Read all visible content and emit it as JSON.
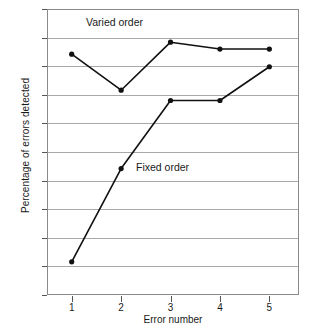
{
  "chart_data": {
    "type": "line",
    "title": "",
    "xlabel": "Error number",
    "ylabel": "Percentage of errors detected",
    "x": [
      1,
      2,
      3,
      4,
      5
    ],
    "xtick_labels": [
      "1",
      "2",
      "3",
      "4",
      "5"
    ],
    "ytick_labels": [
      "50",
      "55",
      "60",
      "65",
      "70",
      "75",
      "80",
      "85",
      "90",
      "95",
      "100"
    ],
    "ytick_values": [
      50,
      55,
      60,
      65,
      70,
      75,
      80,
      85,
      90,
      95,
      100
    ],
    "xlim": [
      0.5,
      5.6
    ],
    "ylim": [
      50,
      100
    ],
    "grid": "horizontal",
    "legend_position": "inline-annotations",
    "series": [
      {
        "name": "Varied order",
        "values": [
          92.1,
          85.8,
          94.2,
          93.0,
          93.0
        ],
        "marker": "circle",
        "color": "#111111"
      },
      {
        "name": "Fixed order",
        "values": [
          55.8,
          72.1,
          84.0,
          84.0,
          89.9
        ],
        "marker": "circle",
        "color": "#111111"
      }
    ],
    "annotations": [
      {
        "text": "Varied order",
        "series": "Varied order"
      },
      {
        "text": "Fixed order",
        "series": "Fixed order"
      }
    ]
  },
  "axes": {
    "y_title": "Percentage of errors detected",
    "x_title": "Error number"
  },
  "colors": {
    "line": "#111111",
    "grid": "#a8a8a8",
    "frame": "#8a8a8a",
    "background": "#ffffff",
    "text": "#1a1a1a"
  }
}
